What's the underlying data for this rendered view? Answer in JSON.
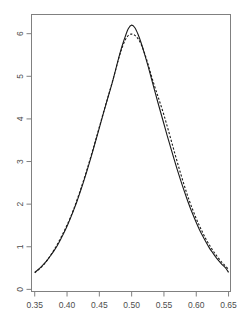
{
  "chart_data": {
    "type": "line",
    "title": "",
    "subtitle": "",
    "xlabel": "",
    "ylabel": "",
    "xlim": [
      0.345,
      0.653
    ],
    "ylim": [
      -0.05,
      6.45
    ],
    "grid": false,
    "legend": "none",
    "background": "#ffffff",
    "axis_color": "#808080",
    "box": true,
    "xticks": [
      0.35,
      0.4,
      0.45,
      0.5,
      0.55,
      0.6,
      0.65
    ],
    "xtick_labels": [
      "0.35",
      "0.40",
      "0.45",
      "0.50",
      "0.55",
      "0.60",
      "0.65"
    ],
    "yticks": [
      0,
      1,
      2,
      3,
      4,
      5,
      6
    ],
    "ytick_labels": [
      "0",
      "1",
      "2",
      "3",
      "4",
      "5",
      "6"
    ],
    "series": [
      {
        "name": "solid-curve",
        "style": "solid",
        "color": "#1a1a1a",
        "width": 1.1,
        "x": [
          0.35,
          0.355,
          0.36,
          0.365,
          0.37,
          0.375,
          0.38,
          0.385,
          0.39,
          0.395,
          0.4,
          0.405,
          0.41,
          0.415,
          0.42,
          0.425,
          0.43,
          0.435,
          0.44,
          0.445,
          0.45,
          0.455,
          0.46,
          0.465,
          0.47,
          0.475,
          0.48,
          0.485,
          0.49,
          0.495,
          0.5,
          0.505,
          0.51,
          0.515,
          0.52,
          0.525,
          0.53,
          0.535,
          0.54,
          0.545,
          0.55,
          0.555,
          0.56,
          0.565,
          0.57,
          0.575,
          0.58,
          0.585,
          0.59,
          0.595,
          0.6,
          0.605,
          0.61,
          0.615,
          0.62,
          0.625,
          0.63,
          0.635,
          0.64,
          0.645,
          0.65
        ],
        "y": [
          0.4,
          0.46,
          0.53,
          0.61,
          0.7,
          0.8,
          0.91,
          1.03,
          1.17,
          1.32,
          1.48,
          1.66,
          1.85,
          2.05,
          2.27,
          2.5,
          2.74,
          2.99,
          3.25,
          3.52,
          3.79,
          4.06,
          4.33,
          4.59,
          4.85,
          5.14,
          5.43,
          5.7,
          5.93,
          6.12,
          6.2,
          6.14,
          5.98,
          5.77,
          5.52,
          5.26,
          4.98,
          4.7,
          4.42,
          4.15,
          3.88,
          3.61,
          3.35,
          3.09,
          2.84,
          2.6,
          2.37,
          2.15,
          1.94,
          1.75,
          1.57,
          1.4,
          1.25,
          1.11,
          0.98,
          0.87,
          0.76,
          0.67,
          0.58,
          0.51,
          0.4
        ]
      },
      {
        "name": "dashed-curve",
        "style": "dashed",
        "color": "#1a1a1a",
        "width": 1.1,
        "dash": "2.2 1.8",
        "x": [
          0.35,
          0.355,
          0.36,
          0.365,
          0.37,
          0.375,
          0.38,
          0.385,
          0.39,
          0.395,
          0.4,
          0.405,
          0.41,
          0.415,
          0.42,
          0.425,
          0.43,
          0.435,
          0.44,
          0.445,
          0.45,
          0.455,
          0.46,
          0.465,
          0.47,
          0.475,
          0.48,
          0.485,
          0.49,
          0.495,
          0.5,
          0.505,
          0.51,
          0.515,
          0.52,
          0.525,
          0.53,
          0.535,
          0.54,
          0.545,
          0.55,
          0.555,
          0.56,
          0.565,
          0.57,
          0.575,
          0.58,
          0.585,
          0.59,
          0.595,
          0.6,
          0.605,
          0.61,
          0.615,
          0.62,
          0.625,
          0.63,
          0.635,
          0.64,
          0.645,
          0.65
        ],
        "y": [
          0.39,
          0.45,
          0.52,
          0.6,
          0.7,
          0.81,
          0.93,
          1.06,
          1.2,
          1.35,
          1.51,
          1.68,
          1.87,
          2.08,
          2.3,
          2.53,
          2.77,
          3.02,
          3.28,
          3.54,
          3.81,
          4.08,
          4.34,
          4.6,
          4.86,
          5.14,
          5.42,
          5.66,
          5.85,
          5.96,
          5.99,
          5.96,
          5.88,
          5.74,
          5.54,
          5.3,
          5.04,
          4.79,
          4.56,
          4.33,
          4.09,
          3.83,
          3.56,
          3.29,
          3.02,
          2.76,
          2.51,
          2.27,
          2.05,
          1.85,
          1.66,
          1.49,
          1.33,
          1.18,
          1.05,
          0.93,
          0.82,
          0.72,
          0.63,
          0.55,
          0.47
        ]
      }
    ]
  }
}
